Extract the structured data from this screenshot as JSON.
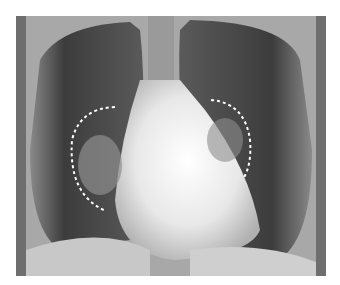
{
  "image": {
    "subject": "chest-x-ray",
    "view": "frontal (PA)",
    "annotations": [
      {
        "type": "dashed-arc",
        "side": "left",
        "color": "#ffffff"
      },
      {
        "type": "dashed-arc",
        "side": "right",
        "color": "#ffffff"
      }
    ]
  },
  "colors": {
    "border": "#6e6e6e",
    "lung": "#3a3a3a",
    "soft_tissue": "#bdbdbd",
    "heart": "#f5f5f5",
    "annotation": "#ffffff"
  }
}
